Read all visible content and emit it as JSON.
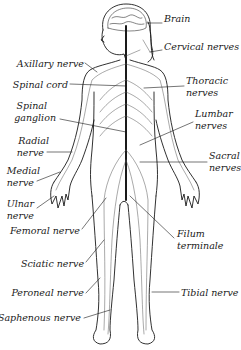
{
  "diagram": {
    "colors": {
      "ink": "#1a1a1a",
      "nerve": "#555555",
      "background": "#ffffff"
    },
    "labels_right": [
      {
        "id": "brain",
        "text": "Brain",
        "x": 164,
        "y": 19
      },
      {
        "id": "cervical",
        "text": "Cervical nerves",
        "x": 164,
        "y": 46
      },
      {
        "id": "thoracic_1",
        "text": "Thoracic",
        "x": 186,
        "y": 81
      },
      {
        "id": "thoracic_2",
        "text": "nerves",
        "x": 186,
        "y": 92
      },
      {
        "id": "lumbar_1",
        "text": "Lumbar",
        "x": 195,
        "y": 113
      },
      {
        "id": "lumbar_2",
        "text": "nerves",
        "x": 195,
        "y": 125
      },
      {
        "id": "sacral_1",
        "text": "Sacral",
        "x": 209,
        "y": 155
      },
      {
        "id": "sacral_2",
        "text": "nerves",
        "x": 209,
        "y": 167
      },
      {
        "id": "filum_1",
        "text": "Filum",
        "x": 177,
        "y": 233
      },
      {
        "id": "filum_2",
        "text": "terminale",
        "x": 177,
        "y": 245
      },
      {
        "id": "tibial",
        "text": "Tibial nerve",
        "x": 181,
        "y": 288
      }
    ],
    "labels_left": [
      {
        "id": "axillary",
        "text": "Axillary nerve",
        "right": 84,
        "y": 59
      },
      {
        "id": "spinal_cord",
        "text": "Spinal cord",
        "right": 68,
        "y": 80
      },
      {
        "id": "spinal_ganglion_1",
        "text": "Spinal",
        "right": 47,
        "y": 101
      },
      {
        "id": "spinal_ganglion_2",
        "text": "ganglion",
        "right": 56,
        "y": 113
      },
      {
        "id": "radial_1",
        "text": "Radial",
        "right": 49,
        "y": 135
      },
      {
        "id": "radial_2",
        "text": "nerve",
        "right": 44,
        "y": 147
      },
      {
        "id": "medial_1",
        "text": "Medial",
        "right": 40,
        "y": 164
      },
      {
        "id": "medial_2",
        "text": "nerve",
        "right": 34,
        "y": 176
      },
      {
        "id": "ulnar_1",
        "text": "Ulnar",
        "right": 34,
        "y": 198
      },
      {
        "id": "ulnar_2",
        "text": "nerve",
        "right": 34,
        "y": 210
      },
      {
        "id": "femoral",
        "text": "Femoral nerve",
        "right": 80,
        "y": 226
      },
      {
        "id": "sciatic",
        "text": "Sciatic nerve",
        "right": 84,
        "y": 259
      },
      {
        "id": "peroneal",
        "text": "Peroneal nerve",
        "right": 84,
        "y": 288
      },
      {
        "id": "saphenous",
        "text": "Saphenous nerve",
        "right": 81,
        "y": 313
      }
    ]
  }
}
